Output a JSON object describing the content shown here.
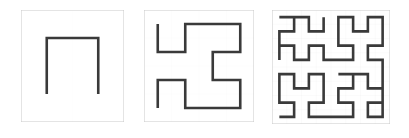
{
  "figure": {
    "title": "",
    "caption": "",
    "background_color": "#ffffff",
    "width": 409,
    "height": 138
  },
  "style": {
    "grid_color": "#bfbfbf",
    "grid_width": 0.9,
    "border_color": "#c9c9c9",
    "curve_color": "#3a3a3a",
    "curve_width": 2.6
  },
  "panels": [
    {
      "name": "hilbert-order-1",
      "label": "",
      "order": 1,
      "grid_divisions": 2,
      "box": {
        "x": 21,
        "y": 10,
        "w": 103,
        "h": 112
      },
      "points": [
        [
          0.5,
          1.5
        ],
        [
          0.5,
          0.5
        ],
        [
          1.5,
          0.5
        ],
        [
          1.5,
          1.5
        ]
      ]
    },
    {
      "name": "hilbert-order-2",
      "label": "",
      "order": 2,
      "grid_divisions": 4,
      "box": {
        "x": 144,
        "y": 10,
        "w": 110,
        "h": 112
      },
      "points": [
        [
          0.5,
          3.5
        ],
        [
          0.5,
          2.5
        ],
        [
          1.5,
          2.5
        ],
        [
          1.5,
          3.5
        ],
        [
          2.5,
          3.5
        ],
        [
          3.5,
          3.5
        ],
        [
          3.5,
          2.5
        ],
        [
          2.5,
          2.5
        ],
        [
          2.5,
          1.5
        ],
        [
          3.5,
          1.5
        ],
        [
          3.5,
          0.5
        ],
        [
          2.5,
          0.5
        ],
        [
          1.5,
          0.5
        ],
        [
          1.5,
          1.5
        ],
        [
          0.5,
          1.5
        ],
        [
          0.5,
          0.5
        ]
      ]
    },
    {
      "name": "hilbert-order-3",
      "label": "",
      "order": 3,
      "grid_divisions": 8,
      "box": {
        "x": 272,
        "y": 10,
        "w": 118,
        "h": 114
      },
      "points": [
        [
          0.5,
          7.5
        ],
        [
          1.5,
          7.5
        ],
        [
          1.5,
          6.5
        ],
        [
          0.5,
          6.5
        ],
        [
          0.5,
          5.5
        ],
        [
          0.5,
          4.5
        ],
        [
          1.5,
          4.5
        ],
        [
          1.5,
          5.5
        ],
        [
          2.5,
          5.5
        ],
        [
          2.5,
          4.5
        ],
        [
          3.5,
          4.5
        ],
        [
          3.5,
          5.5
        ],
        [
          3.5,
          6.5
        ],
        [
          2.5,
          6.5
        ],
        [
          2.5,
          7.5
        ],
        [
          3.5,
          7.5
        ],
        [
          4.5,
          7.5
        ],
        [
          5.5,
          7.5
        ],
        [
          5.5,
          6.5
        ],
        [
          4.5,
          6.5
        ],
        [
          4.5,
          5.5
        ],
        [
          5.5,
          5.5
        ],
        [
          5.5,
          4.5
        ],
        [
          4.5,
          4.5
        ],
        [
          6.5,
          4.5
        ],
        [
          6.5,
          5.5
        ],
        [
          7.5,
          5.5
        ],
        [
          7.5,
          4.5
        ],
        [
          7.5,
          6.5
        ],
        [
          6.5,
          6.5
        ],
        [
          6.5,
          7.5
        ],
        [
          7.5,
          7.5
        ],
        [
          7.5,
          3.5
        ],
        [
          6.5,
          3.5
        ],
        [
          6.5,
          2.5
        ],
        [
          7.5,
          2.5
        ],
        [
          7.5,
          1.5
        ],
        [
          7.5,
          0.5
        ],
        [
          6.5,
          0.5
        ],
        [
          6.5,
          1.5
        ],
        [
          5.5,
          1.5
        ],
        [
          5.5,
          0.5
        ],
        [
          4.5,
          0.5
        ],
        [
          4.5,
          1.5
        ],
        [
          4.5,
          2.5
        ],
        [
          5.5,
          2.5
        ],
        [
          5.5,
          3.5
        ],
        [
          4.5,
          3.5
        ],
        [
          3.5,
          3.5
        ],
        [
          3.5,
          2.5
        ],
        [
          2.5,
          2.5
        ],
        [
          2.5,
          3.5
        ],
        [
          1.5,
          3.5
        ],
        [
          1.5,
          2.5
        ],
        [
          0.5,
          2.5
        ],
        [
          0.5,
          3.5
        ],
        [
          0.5,
          1.5
        ],
        [
          1.5,
          1.5
        ],
        [
          1.5,
          0.5
        ],
        [
          0.5,
          0.5
        ],
        [
          2.5,
          0.5
        ],
        [
          2.5,
          1.5
        ],
        [
          3.5,
          1.5
        ],
        [
          3.5,
          0.5
        ]
      ]
    }
  ],
  "chart_data": {
    "type": "line",
    "xlabel": "",
    "ylabel": "",
    "series": [
      {
        "name": "Order 1 (n = 1)",
        "grid": "2 x 2",
        "segments": 3,
        "vertices": 4
      },
      {
        "name": "Order 2 (n = 2)",
        "grid": "4 x 4",
        "segments": 15,
        "vertices": 16
      },
      {
        "name": "Order 3 (n = 3)",
        "grid": "8 x 8",
        "segments": 63,
        "vertices": 64
      }
    ],
    "legend_position": "none",
    "grid": true
  }
}
